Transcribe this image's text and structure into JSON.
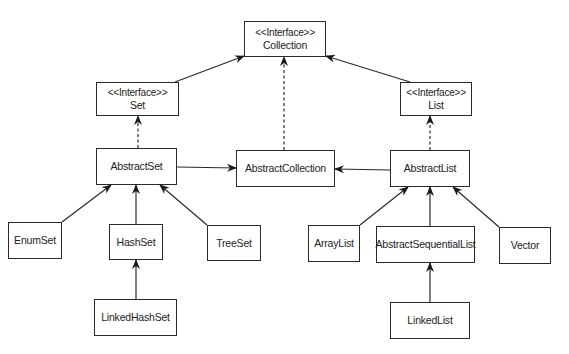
{
  "diagram": {
    "type": "uml-class-hierarchy",
    "nodes": {
      "collection": {
        "stereotype": "<<Interface>>",
        "name": "Collection"
      },
      "set": {
        "stereotype": "<<Interface>>",
        "name": "Set"
      },
      "list": {
        "stereotype": "<<Interface>>",
        "name": "List"
      },
      "abstract_set": {
        "name": "AbstractSet"
      },
      "abstract_collection": {
        "name": "AbstractCollection"
      },
      "abstract_list": {
        "name": "AbstractList"
      },
      "enum_set": {
        "name": "EnumSet"
      },
      "hash_set": {
        "name": "HashSet"
      },
      "tree_set": {
        "name": "TreeSet"
      },
      "linked_hash_set": {
        "name": "LinkedHashSet"
      },
      "array_list": {
        "name": "ArrayList"
      },
      "abstract_sequential_list": {
        "name": "AbstractSequentialList"
      },
      "vector": {
        "name": "Vector"
      },
      "linked_list": {
        "name": "LinkedList"
      }
    },
    "edges": [
      {
        "from": "Set",
        "to": "Collection",
        "style": "solid"
      },
      {
        "from": "List",
        "to": "Collection",
        "style": "solid"
      },
      {
        "from": "AbstractCollection",
        "to": "Collection",
        "style": "dashed"
      },
      {
        "from": "AbstractSet",
        "to": "Set",
        "style": "dashed"
      },
      {
        "from": "AbstractList",
        "to": "List",
        "style": "dashed"
      },
      {
        "from": "AbstractSet",
        "to": "AbstractCollection",
        "style": "solid"
      },
      {
        "from": "AbstractList",
        "to": "AbstractCollection",
        "style": "solid"
      },
      {
        "from": "EnumSet",
        "to": "AbstractSet",
        "style": "solid"
      },
      {
        "from": "HashSet",
        "to": "AbstractSet",
        "style": "solid"
      },
      {
        "from": "TreeSet",
        "to": "AbstractSet",
        "style": "solid"
      },
      {
        "from": "LinkedHashSet",
        "to": "HashSet",
        "style": "solid"
      },
      {
        "from": "ArrayList",
        "to": "AbstractList",
        "style": "solid"
      },
      {
        "from": "AbstractSequentialList",
        "to": "AbstractList",
        "style": "solid"
      },
      {
        "from": "Vector",
        "to": "AbstractList",
        "style": "solid"
      },
      {
        "from": "LinkedList",
        "to": "AbstractSequentialList",
        "style": "solid"
      }
    ]
  },
  "colors": {
    "line": "#2a2a2a",
    "background": "#ffffff"
  }
}
